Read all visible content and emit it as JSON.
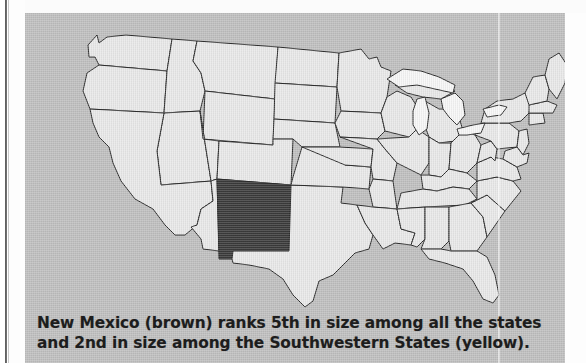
{
  "page": {
    "background_color": "#ffffff",
    "panel_color": "#bfbfbf"
  },
  "map": {
    "title": "United States map with New Mexico highlighted",
    "land_fill_color": "#e9e9e9",
    "water_fill_color": "#f7f7f7",
    "border_color": "#2b2b2b",
    "highlight_fill_color": "#3a3a3a",
    "highlighted_state": "New Mexico",
    "lakes": [
      "Lake Superior",
      "Lake Michigan",
      "Lake Huron",
      "Lake Erie",
      "Lake Ontario"
    ]
  },
  "caption": {
    "line1": "New Mexico (brown) ranks 5th in size among all the states",
    "line2": "and 2nd in size among the Southwestern States (yellow)."
  }
}
